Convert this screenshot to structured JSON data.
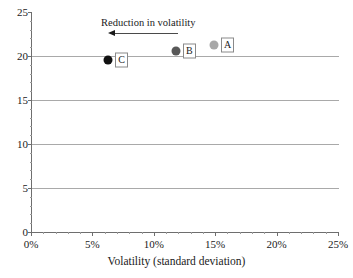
{
  "chart_data": {
    "type": "scatter",
    "title": "",
    "xlabel": "Volatility (standard deviation)",
    "ylabel": "",
    "xlim": [
      0,
      25
    ],
    "ylim": [
      0,
      25
    ],
    "grid": true,
    "legend": "none",
    "x_tick_labels": [
      "0%",
      "5%",
      "10%",
      "15%",
      "20%",
      "25%"
    ],
    "x_tick_values": [
      0,
      5,
      10,
      15,
      20,
      25
    ],
    "y_tick_labels": [
      "0",
      "5",
      "10",
      "15",
      "20",
      "25"
    ],
    "y_tick_values": [
      0,
      5,
      10,
      15,
      20,
      25
    ],
    "points": [
      {
        "label": "A",
        "x": 14.9,
        "y": 21.2,
        "color": "#a8a8a8"
      },
      {
        "label": "B",
        "x": 11.8,
        "y": 20.6,
        "color": "#585858"
      },
      {
        "label": "C",
        "x": 6.3,
        "y": 19.6,
        "color": "#111111"
      }
    ],
    "annotations": [
      {
        "name": "reduction-in-volatility",
        "text": "Reduction in volatility",
        "direction": "left"
      }
    ]
  },
  "annotation": {
    "text": "Reduction in volatility"
  },
  "axis": {
    "x_title": "Volatility (standard deviation)"
  },
  "clipped_header": {
    "text": ""
  }
}
